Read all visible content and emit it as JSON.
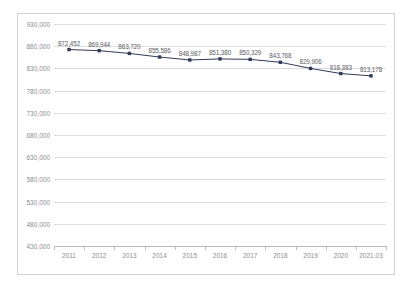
{
  "chart_title": "",
  "chart_data": {
    "type": "line",
    "title": "",
    "xlabel": "",
    "ylabel": "",
    "categories": [
      "2011",
      "2012",
      "2013",
      "2014",
      "2015",
      "2016",
      "2017",
      "2018",
      "2019",
      "2020",
      "2021.03"
    ],
    "values": [
      872452,
      869944,
      863720,
      855586,
      848987,
      851380,
      850329,
      843768,
      829906,
      818383,
      813178
    ],
    "value_labels": [
      "872,452",
      "869,944",
      "863,720",
      "855,586",
      "848,987",
      "851,380",
      "850,329",
      "843,768",
      "829,906",
      "818,383",
      "813,178"
    ],
    "ylim": [
      430000,
      930000
    ],
    "ytick_step": 50000,
    "ytick_labels": [
      "930,000",
      "880,000",
      "830,000",
      "780,000",
      "730,000",
      "680,000",
      "630,000",
      "580,000",
      "530,000",
      "480,000",
      "430,000"
    ],
    "ytick_values": [
      930000,
      880000,
      830000,
      780000,
      730000,
      680000,
      630000,
      580000,
      530000,
      480000,
      430000
    ],
    "grid": "horizontal",
    "legend": "none",
    "series": [
      {
        "name": "series-1",
        "values": [
          872452,
          869944,
          863720,
          855586,
          848987,
          851380,
          850329,
          843768,
          829906,
          818383,
          813178
        ]
      }
    ],
    "colors": {
      "line": "#2f3a56",
      "marker": "#2f3a56",
      "gridline": "#dcdce1",
      "axis": "#b9b9bf",
      "tick_text": "#8c8c92",
      "data_label_text": "#5c5c62",
      "frame": "#cfcfd4",
      "background": "#ffffff"
    }
  }
}
